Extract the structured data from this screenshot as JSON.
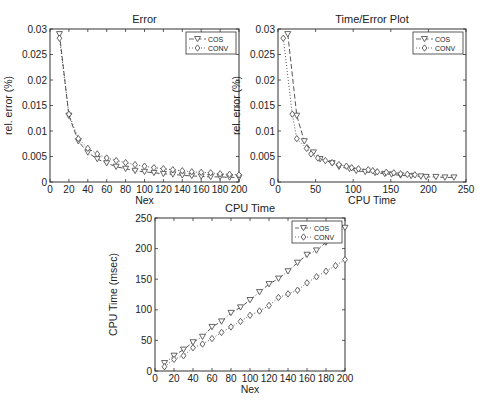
{
  "chart_data": [
    {
      "type": "line",
      "title": "Error",
      "xlabel": "Nex",
      "ylabel": "rel. error (%)",
      "xlim": [
        0,
        200
      ],
      "ylim": [
        0,
        0.03
      ],
      "xticks": [
        0,
        20,
        40,
        60,
        80,
        100,
        120,
        140,
        160,
        180,
        200
      ],
      "yticks": [
        0,
        0.005,
        0.01,
        0.015,
        0.02,
        0.025,
        0.03
      ],
      "ytick_labels": [
        "0",
        "0.005",
        "0.01",
        "0.015",
        "0.02",
        "0.025",
        "0.03"
      ],
      "grid": false,
      "legend_position": "upper right",
      "x": [
        10,
        20,
        30,
        40,
        50,
        60,
        70,
        80,
        90,
        100,
        110,
        120,
        130,
        140,
        150,
        160,
        170,
        180,
        190,
        200
      ],
      "series": [
        {
          "name": "COS",
          "marker": "triangle-down",
          "line": "dashed",
          "values": [
            0.029,
            0.013,
            0.008,
            0.0058,
            0.0045,
            0.0037,
            0.003,
            0.0026,
            0.0022,
            0.002,
            0.0018,
            0.0016,
            0.0015,
            0.0013,
            0.0012,
            0.0011,
            0.001,
            0.001,
            0.0009,
            0.0009
          ]
        },
        {
          "name": "CONV",
          "marker": "diamond",
          "line": "dotted",
          "values": [
            0.0282,
            0.0133,
            0.0085,
            0.0066,
            0.0055,
            0.0047,
            0.0042,
            0.0038,
            0.0034,
            0.0031,
            0.0028,
            0.0026,
            0.0024,
            0.0022,
            0.002,
            0.0019,
            0.0018,
            0.0016,
            0.0015,
            0.0014
          ]
        }
      ]
    },
    {
      "type": "line",
      "title": "Time/Error Plot",
      "xlabel": "CPU Time",
      "ylabel": "rel. error (%)",
      "xlim": [
        0,
        250
      ],
      "ylim": [
        0,
        0.03
      ],
      "xticks": [
        0,
        50,
        100,
        150,
        200,
        250
      ],
      "yticks": [
        0,
        0.005,
        0.01,
        0.015,
        0.02,
        0.025,
        0.03
      ],
      "ytick_labels": [
        "0",
        "0.005",
        "0.01",
        "0.015",
        "0.02",
        "0.025",
        "0.03"
      ],
      "grid": false,
      "legend_position": "upper right",
      "series": [
        {
          "name": "COS",
          "marker": "triangle-down",
          "line": "dashed",
          "x": [
            13,
            25,
            35,
            47,
            56,
            72,
            81,
            95,
            104,
            116,
            129,
            142,
            151,
            163,
            177,
            190,
            197,
            210,
            222,
            234
          ],
          "values": [
            0.029,
            0.013,
            0.008,
            0.0058,
            0.0045,
            0.0037,
            0.003,
            0.0026,
            0.0022,
            0.002,
            0.0018,
            0.0016,
            0.0015,
            0.0013,
            0.0012,
            0.0011,
            0.001,
            0.001,
            0.0009,
            0.0009
          ]
        },
        {
          "name": "CONV",
          "marker": "diamond",
          "line": "dotted",
          "x": [
            7,
            19,
            25,
            38,
            44,
            53,
            63,
            72,
            81,
            91,
            98,
            107,
            120,
            126,
            132,
            144,
            154,
            163,
            172,
            182
          ],
          "values": [
            0.0282,
            0.0133,
            0.0085,
            0.0066,
            0.0055,
            0.0047,
            0.0042,
            0.0038,
            0.0034,
            0.0031,
            0.0028,
            0.0026,
            0.0024,
            0.0022,
            0.002,
            0.0019,
            0.0018,
            0.0016,
            0.0015,
            0.0014
          ]
        }
      ]
    },
    {
      "type": "line",
      "title": "CPU Time",
      "xlabel": "Nex",
      "ylabel": "CPU Time (msec)",
      "xlim": [
        0,
        200
      ],
      "ylim": [
        0,
        250
      ],
      "xticks": [
        0,
        20,
        40,
        60,
        80,
        100,
        120,
        140,
        160,
        180,
        200
      ],
      "yticks": [
        0,
        50,
        100,
        150,
        200,
        250
      ],
      "ytick_labels": [
        "0",
        "50",
        "100",
        "150",
        "200",
        "250"
      ],
      "grid": false,
      "legend_position": "upper right",
      "x": [
        10,
        20,
        30,
        40,
        50,
        60,
        70,
        80,
        90,
        100,
        110,
        120,
        130,
        140,
        150,
        160,
        170,
        180,
        190,
        200
      ],
      "series": [
        {
          "name": "COS",
          "marker": "triangle-down",
          "line": "dash-dot",
          "values": [
            13,
            25,
            35,
            47,
            56,
            72,
            81,
            95,
            104,
            116,
            129,
            142,
            151,
            163,
            177,
            190,
            197,
            210,
            222,
            234
          ]
        },
        {
          "name": "CONV",
          "marker": "diamond",
          "line": "dotted",
          "values": [
            7,
            19,
            25,
            38,
            44,
            53,
            63,
            72,
            81,
            91,
            98,
            107,
            120,
            126,
            132,
            144,
            154,
            163,
            172,
            182
          ]
        }
      ]
    }
  ],
  "layout": {
    "panels": [
      {
        "left": 50,
        "top": 29,
        "right": 239,
        "bottom": 182
      },
      {
        "left": 278,
        "top": 29,
        "right": 466,
        "bottom": 182
      },
      {
        "left": 155,
        "top": 218,
        "right": 345,
        "bottom": 371
      }
    ],
    "colors": {
      "axis": "#333333",
      "line": "#444444",
      "marker": "#555555"
    }
  }
}
